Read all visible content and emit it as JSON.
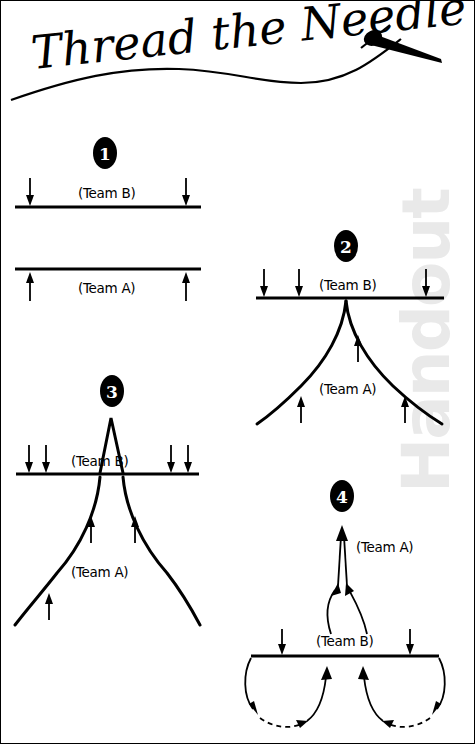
{
  "page": {
    "title": "Thread the Needle",
    "watermark": "Handout",
    "background_color": "#ffffff",
    "ink_color": "#000000",
    "watermark_color": "#e9e9e9"
  },
  "header": {
    "title_text": "Thread the Needle",
    "graphic": "needle-and-thread"
  },
  "diagrams": [
    {
      "badge": "1",
      "labels": {
        "top": "(Team B)",
        "bottom": "(Team A)"
      },
      "arrows": {
        "down": 2,
        "up": 2
      },
      "description": "Two parallel straight lines, Team B above with two down arrows, Team A below with two up arrows."
    },
    {
      "badge": "2",
      "labels": {
        "top": "(Team B)",
        "bottom": "(Team A)"
      },
      "arrows": {
        "down": 3,
        "up": 3
      },
      "description": "Team B straight line with three down arrows; Team A forms a single peak touching the line and flaring outward with three up arrows."
    },
    {
      "badge": "3",
      "labels": {
        "top": "(Team B)",
        "bottom": "(Team A)"
      },
      "arrows": {
        "down": 4,
        "up": 3
      },
      "description": "Team B straight line with a narrow peak above it and four down arrows; Team A forms a wide double curve below with three up arrows."
    },
    {
      "badge": "4",
      "labels": {
        "top": "(Team A)",
        "bottom": "(Team B)"
      },
      "arrows": {
        "down": 2,
        "up": 3
      },
      "description": "Team A exits upward as converging arrows; Team B line with two down arrows and two looping paths with dashed return arcs below."
    }
  ],
  "labels": {
    "team_a": "(Team A)",
    "team_b": "(Team B)"
  }
}
